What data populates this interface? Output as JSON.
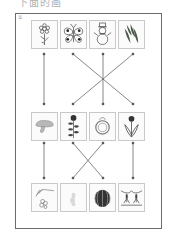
{
  "header": {
    "text": "下面的画"
  },
  "panel": {
    "label": "①"
  },
  "rows": [
    {
      "name": "top",
      "items": [
        {
          "id": "flower",
          "icon": "flower-icon"
        },
        {
          "id": "butterfly",
          "icon": "butterfly-icon"
        },
        {
          "id": "snowman",
          "icon": "snowman-icon"
        },
        {
          "id": "pine-branch",
          "icon": "pine-branch-icon"
        }
      ]
    },
    {
      "name": "middle",
      "items": [
        {
          "id": "mushroom",
          "icon": "mushroom-icon"
        },
        {
          "id": "flower-stalk",
          "icon": "flower-stalk-icon"
        },
        {
          "id": "wreath",
          "icon": "wreath-icon"
        },
        {
          "id": "tulip",
          "icon": "tulip-icon"
        }
      ]
    },
    {
      "name": "bottom",
      "items": [
        {
          "id": "wheat-harvest",
          "icon": "wheat-icon"
        },
        {
          "id": "faded-leaf",
          "icon": "leaf-icon"
        },
        {
          "id": "watermelon",
          "icon": "watermelon-icon"
        },
        {
          "id": "rice-seedlings",
          "icon": "rice-seedling-icon"
        }
      ]
    }
  ],
  "connections": {
    "top_to_middle": [
      [
        1,
        1
      ],
      [
        2,
        4
      ],
      [
        3,
        3
      ],
      [
        4,
        2
      ]
    ],
    "middle_to_bottom": [
      [
        1,
        1
      ],
      [
        2,
        3
      ],
      [
        3,
        2
      ],
      [
        4,
        4
      ]
    ]
  },
  "colors": {
    "line": "#555555",
    "frame": "#6b6b6b",
    "box_border": "#c9c9c9"
  }
}
